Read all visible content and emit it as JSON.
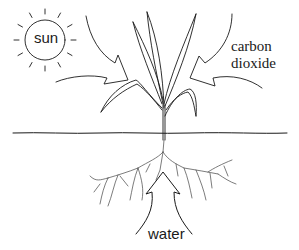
{
  "diagram": {
    "labels": {
      "sun": "sun",
      "carbon_dioxide_line1": "carbon",
      "carbon_dioxide_line2": "dioxide",
      "water": "water"
    },
    "elements": [
      {
        "id": "sun",
        "type": "circle-with-rays",
        "label": "sun"
      },
      {
        "id": "arrow-left",
        "type": "curved-arrow",
        "direction": "toward plant from upper-left"
      },
      {
        "id": "arrow-right",
        "type": "curved-arrow",
        "direction": "toward plant from right",
        "label": "carbon dioxide"
      },
      {
        "id": "arrow-bottom",
        "type": "upward-arrow",
        "direction": "up into roots",
        "label": "water"
      },
      {
        "id": "plant",
        "type": "illustration",
        "parts": [
          "leaves",
          "stem",
          "roots"
        ]
      },
      {
        "id": "ground",
        "type": "line"
      }
    ],
    "colors": {
      "stroke": "#1a1a1a",
      "background": "#ffffff"
    }
  }
}
